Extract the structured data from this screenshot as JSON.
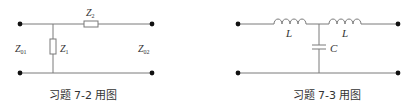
{
  "figures": [
    {
      "id": "fig-7-2",
      "caption": "习题 7-2 用图",
      "labels": {
        "input_impedance": {
          "main": "Z",
          "sub": "01"
        },
        "output_impedance": {
          "main": "Z",
          "sub": "02"
        },
        "shunt": {
          "main": "Z",
          "sub": "1"
        },
        "series": {
          "main": "Z",
          "sub": "2"
        }
      }
    },
    {
      "id": "fig-7-3",
      "caption": "习题 7-3 用图",
      "labels": {
        "inductor_left": "L",
        "inductor_right": "L",
        "capacitor": "C"
      }
    }
  ],
  "colors": {
    "wire": "#7a7a7a",
    "terminal": "#111111",
    "text": "#333333"
  }
}
